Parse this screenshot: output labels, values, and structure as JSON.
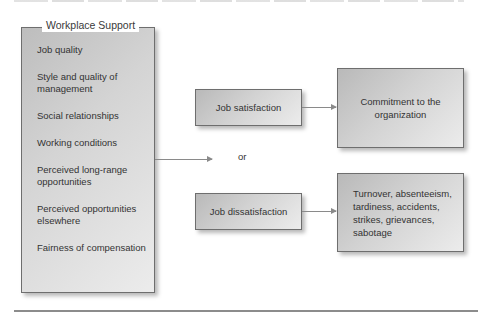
{
  "diagram": {
    "cropped_heading": "",
    "workplace_support": {
      "title": "Workplace Support",
      "items": [
        "Job quality",
        "Style and quality of management",
        "Social relationships",
        "Working conditions",
        "Perceived long-range opportunities",
        "Perceived opportunities elsewhere",
        "Fairness of compensation"
      ]
    },
    "connector_label": "or",
    "outcomes": {
      "satisfaction": {
        "label": "Job satisfaction",
        "result": "Commitment to the organization"
      },
      "dissatisfaction": {
        "label": "Job dissatisfaction",
        "result": "Turnover, absenteeism, tardiness, accidents, strikes, grievances, sabotage"
      }
    },
    "colors": {
      "box_border": "#6e6e6e",
      "box_gradient_dark": "#b9b9b9",
      "box_gradient_light": "#ececec",
      "arrow": "#8a8a8a",
      "text": "#333333",
      "rule": "#8c8c8c"
    }
  }
}
